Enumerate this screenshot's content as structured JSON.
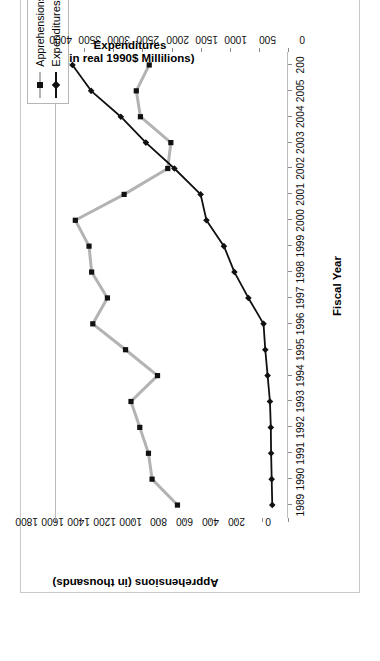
{
  "figure": {
    "label": "Figure 1.1.",
    "caption": "Figure 1.1. Border Enforcement Expenditures and Border Patrol Apprehensions, FY 1989–2006"
  },
  "legend": {
    "position": "top-right",
    "items": [
      {
        "label": "Apprehensions",
        "color": "#b3b3b3",
        "marker": "square"
      },
      {
        "label": "Expenditures",
        "color": "#111111",
        "marker": "diamond"
      }
    ]
  },
  "axes": {
    "x_title": "Fiscal Year",
    "y_left_title_line1": "Apprehensions (in thousands)",
    "y_right_title_line1": "Expenditures",
    "y_right_title_line2": "(in real 1990$ Millilions)"
  },
  "chart_data": {
    "type": "line",
    "title": "Border Enforcement Expenditures and Border Patrol Apprehensions, FY 1989–2006",
    "xlabel": "Fiscal Year",
    "ylabel": "Apprehensions (in thousands)",
    "y2label": "Expenditures (in real 1990$ Millilions)",
    "grid": false,
    "legend_position": "top-right",
    "orientation": "rotated-90-ccw",
    "categories": [
      1989,
      1990,
      1991,
      1992,
      1993,
      1994,
      1995,
      1996,
      1997,
      1998,
      1999,
      2000,
      2001,
      2002,
      2003,
      2004,
      2005,
      2006
    ],
    "xtick_labels": [
      "1989",
      "1990",
      "1991",
      "1992",
      "1993",
      "1994",
      "1995",
      "1996",
      "1997",
      "1998",
      "1999",
      "2000",
      "2001",
      "2002",
      "2003",
      "2004",
      "2005",
      "200"
    ],
    "yticks": [
      0,
      200,
      400,
      600,
      800,
      1000,
      1200,
      1400,
      1600,
      1800
    ],
    "ylim": [
      0,
      1800
    ],
    "y2ticks": [
      0,
      500,
      1000,
      1500,
      2000,
      2500,
      3000,
      3500,
      4000
    ],
    "y2lim": [
      0,
      4000
    ],
    "series": [
      {
        "name": "Apprehensions",
        "axis": "left",
        "units": "thousands",
        "color": "#b3b3b3",
        "marker": "square",
        "values": [
          854,
          1050,
          1078,
          1145,
          1213,
          1008,
          1255,
          1508,
          1395,
          1517,
          1537,
          1643,
          1266,
          929,
          905,
          1140,
          1172,
          1072
        ]
      },
      {
        "name": "Expenditures",
        "axis": "right",
        "units": "real 1990 $ millions",
        "color": "#111111",
        "marker": "diamond",
        "values": [
          270,
          280,
          290,
          295,
          310,
          350,
          390,
          420,
          680,
          920,
          1100,
          1400,
          1500,
          1950,
          2440,
          2870,
          3380,
          3700
        ]
      }
    ]
  }
}
